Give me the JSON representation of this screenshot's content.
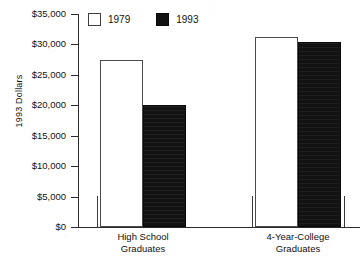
{
  "chart_data": {
    "type": "bar",
    "title": "",
    "xlabel": "",
    "ylabel": "1993 Dollars",
    "categories": [
      "High School Graduates",
      "4-Year-College Graduates"
    ],
    "category_lines": [
      [
        "High School",
        "Graduates"
      ],
      [
        "4-Year-College",
        "Graduates"
      ]
    ],
    "series": [
      {
        "name": "1979",
        "values": [
          27500,
          31200
        ],
        "color": "#ffffff"
      },
      {
        "name": "1993",
        "values": [
          20100,
          30400
        ],
        "color": "#121212"
      }
    ],
    "ylim": [
      0,
      35000
    ],
    "yticks": [
      0,
      5000,
      10000,
      15000,
      20000,
      25000,
      30000,
      35000
    ],
    "ytick_labels": [
      "$0",
      "$5,000",
      "$10,000",
      "$15,000",
      "$20,000",
      "$25,000",
      "$30,000",
      "$35,000"
    ],
    "grid": false,
    "legend_position": "top-left-inside"
  },
  "legend": {
    "entries": [
      {
        "label": "1979",
        "swatch": "open-square-swatch"
      },
      {
        "label": "1993",
        "swatch": "filled-square-swatch"
      }
    ]
  },
  "axis": {
    "y_title": "1993 Dollars"
  }
}
